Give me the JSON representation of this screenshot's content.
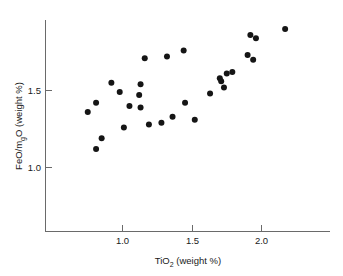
{
  "chart_data": {
    "type": "scatter",
    "title": "",
    "xlabel": "TiO2 (weight %)",
    "xlabel_parts": {
      "lead": "TiO",
      "sub": "2",
      "tail": " (weight %)"
    },
    "ylabel": "FeO/mgO (weight %)",
    "ylabel_parts": {
      "lead": "FeO/m",
      "sub": "g",
      "tail": "O (weight %)"
    },
    "xlim": [
      0.59,
      2.28
    ],
    "ylim": [
      0.62,
      1.8
    ],
    "xticks": [
      1.0,
      1.5,
      2.0
    ],
    "xticklabels": [
      "1.0",
      "1.5",
      "2.0"
    ],
    "yticks": [
      1.0,
      1.5
    ],
    "yticklabels": [
      "1.0",
      "1.5"
    ],
    "grid": false,
    "legend": null,
    "marker": "filled-circle",
    "marker_color": "#151515",
    "marker_size_px": 4.2,
    "series": [
      {
        "name": "samples",
        "points": [
          [
            0.81,
            1.42
          ],
          [
            0.75,
            1.36
          ],
          [
            0.85,
            1.19
          ],
          [
            0.81,
            1.12
          ],
          [
            0.92,
            1.55
          ],
          [
            0.98,
            1.49
          ],
          [
            1.05,
            1.4
          ],
          [
            1.01,
            1.26
          ],
          [
            1.13,
            1.54
          ],
          [
            1.12,
            1.47
          ],
          [
            1.13,
            1.39
          ],
          [
            1.16,
            1.71
          ],
          [
            1.19,
            1.28
          ],
          [
            1.28,
            1.29
          ],
          [
            1.32,
            1.72
          ],
          [
            1.36,
            1.33
          ],
          [
            1.44,
            1.76
          ],
          [
            1.45,
            1.42
          ],
          [
            1.52,
            1.31
          ],
          [
            1.63,
            1.48
          ],
          [
            1.7,
            1.58
          ],
          [
            1.71,
            1.56
          ],
          [
            1.73,
            1.52
          ],
          [
            1.75,
            1.61
          ],
          [
            1.79,
            1.62
          ],
          [
            1.9,
            1.73
          ],
          [
            1.92,
            1.86
          ],
          [
            1.94,
            1.7
          ],
          [
            1.96,
            1.84
          ],
          [
            2.17,
            1.9
          ]
        ]
      }
    ]
  },
  "axes": {
    "x_tick_1": "1.0",
    "x_tick_2": "1.5",
    "x_tick_3": "2.0",
    "y_tick_1": "1.0",
    "y_tick_2": "1.5"
  }
}
